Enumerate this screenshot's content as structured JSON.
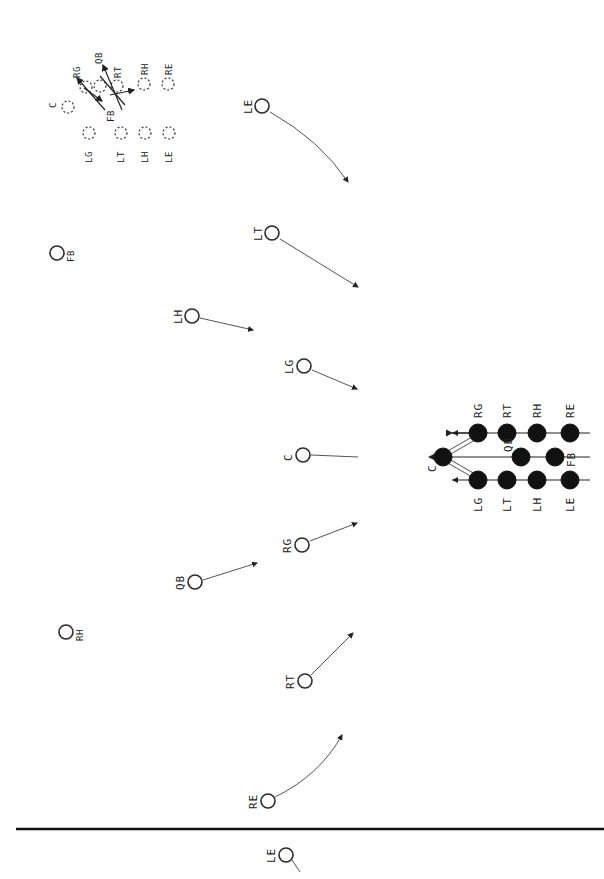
{
  "diagram": {
    "type": "football-play-diagram",
    "orientation": "rotated-90",
    "inset_formation": {
      "description": "dashed-circle formation with crossing motion arrows",
      "players": [
        {
          "label": "C",
          "x": 68,
          "y": 107
        },
        {
          "label": "RG",
          "x": 86,
          "y": 87
        },
        {
          "label": "QB",
          "x": 100,
          "y": 85
        },
        {
          "label": "RT",
          "x": 116,
          "y": 84
        },
        {
          "label": "RH",
          "x": 144,
          "y": 83
        },
        {
          "label": "RE",
          "x": 168,
          "y": 83
        },
        {
          "label": "FB",
          "x": 112,
          "y": 102
        },
        {
          "label": "LG",
          "x": 89,
          "y": 133
        },
        {
          "label": "LT",
          "x": 121,
          "y": 133
        },
        {
          "label": "LH",
          "x": 145,
          "y": 133
        },
        {
          "label": "LE",
          "x": 169,
          "y": 133
        }
      ]
    },
    "defense": [
      {
        "label": "LE",
        "x": 262,
        "y": 106,
        "route_to": [
          348,
          182
        ]
      },
      {
        "label": "FB",
        "x": 57,
        "y": 253
      },
      {
        "label": "LT",
        "x": 272,
        "y": 233,
        "route_to": [
          358,
          287
        ]
      },
      {
        "label": "LH",
        "x": 192,
        "y": 316,
        "route_to": [
          253,
          330
        ]
      },
      {
        "label": "LG",
        "x": 304,
        "y": 366,
        "route_to": [
          357,
          389
        ]
      },
      {
        "label": "C",
        "x": 303,
        "y": 455,
        "route_to": [
          358,
          457
        ]
      },
      {
        "label": "RG",
        "x": 302,
        "y": 545,
        "route_to": [
          357,
          523
        ]
      },
      {
        "label": "QB",
        "x": 195,
        "y": 582,
        "route_to": [
          257,
          563
        ]
      },
      {
        "label": "RH",
        "x": 66,
        "y": 632
      },
      {
        "label": "RT",
        "x": 305,
        "y": 681,
        "route_to": [
          353,
          633
        ]
      },
      {
        "label": "RE",
        "x": 268,
        "y": 801,
        "route_to": [
          342,
          735
        ]
      },
      {
        "label": "LE",
        "x": 286,
        "y": 855
      }
    ],
    "offense": {
      "top_row": [
        {
          "label": "RG",
          "x": 478,
          "y": 433
        },
        {
          "label": "RT",
          "x": 507,
          "y": 433
        },
        {
          "label": "RH",
          "x": 537,
          "y": 433
        },
        {
          "label": "RE",
          "x": 570,
          "y": 433
        }
      ],
      "middle_row": [
        {
          "label": "C",
          "x": 443,
          "y": 457
        },
        {
          "label": "QB",
          "x": 521,
          "y": 457
        },
        {
          "label": "FB",
          "x": 555,
          "y": 457
        }
      ],
      "bottom_row": [
        {
          "label": "LG",
          "x": 478,
          "y": 480
        },
        {
          "label": "LT",
          "x": 507,
          "y": 480
        },
        {
          "label": "LH",
          "x": 537,
          "y": 480
        },
        {
          "label": "LE",
          "x": 570,
          "y": 480
        }
      ]
    },
    "line_of_scrimmage_y": 829
  }
}
